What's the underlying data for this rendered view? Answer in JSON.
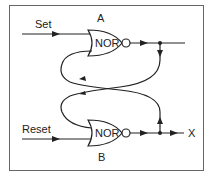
{
  "diagram": {
    "inputs": {
      "set": "Set",
      "reset": "Reset"
    },
    "gates": [
      {
        "id": "A",
        "label": "A",
        "type": "NOR"
      },
      {
        "id": "B",
        "label": "B",
        "type": "NOR"
      }
    ],
    "output": {
      "label": "X"
    },
    "colors": {
      "line": "#222222",
      "border": "#555555",
      "background": "#ffffff"
    }
  }
}
